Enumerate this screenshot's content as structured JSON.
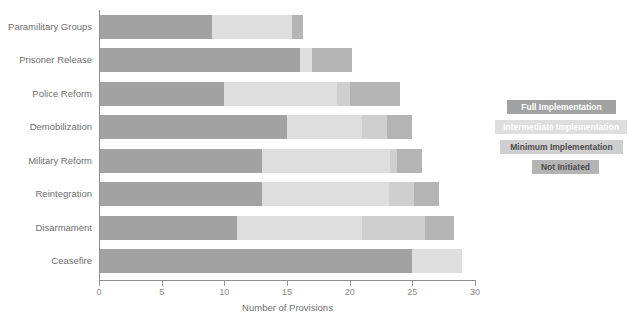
{
  "chart_data": {
    "type": "bar",
    "orientation": "horizontal",
    "stacked": true,
    "title": "",
    "xlabel": "Number of Provisions",
    "ylabel": "",
    "xlim": [
      0,
      30
    ],
    "xticks": [
      0,
      5,
      10,
      15,
      20,
      25,
      30
    ],
    "xtick_labels": [
      "0",
      "5",
      "10",
      "15",
      "20",
      "25",
      "30"
    ],
    "grid": false,
    "legend_position": "right",
    "categories": [
      "Paramilitary Groups",
      "Prisoner Release",
      "Police Reform",
      "Demobilization",
      "Military Reform",
      "Reintegration",
      "Disarmament",
      "Ceasefire"
    ],
    "series": [
      {
        "name": "Full Implementation",
        "color": "#a2a2a2",
        "values": [
          9,
          16,
          10,
          15,
          13,
          13,
          11,
          25
        ]
      },
      {
        "name": "Intermediate Implementation",
        "color": "#dedede",
        "values": [
          6.4,
          1,
          9,
          6,
          10.2,
          10.1,
          10,
          4
        ]
      },
      {
        "name": "Minimum Implementation",
        "color": "#cfcfcf",
        "values": [
          0,
          0,
          1,
          2,
          0.6,
          2,
          5,
          0
        ]
      },
      {
        "name": "Not Initiated",
        "color": "#b4b4b4",
        "values": [
          0.9,
          3.2,
          4,
          2,
          2,
          2,
          2.3,
          0
        ]
      }
    ],
    "totals": [
      16.3,
      20.2,
      24,
      25,
      25.8,
      27.1,
      28.3,
      29
    ]
  },
  "legend": {
    "items": [
      {
        "label": "Full Implementation",
        "key": "full"
      },
      {
        "label": "Intermediate Implementation",
        "key": "intermediate"
      },
      {
        "label": "Minimum Implementation",
        "key": "minimum"
      },
      {
        "label": "Not Initiated",
        "key": "notinit"
      }
    ]
  },
  "colors": {
    "full": "#a2a2a2",
    "intermediate": "#dedede",
    "minimum": "#cfcfcf",
    "notinit": "#b4b4b4",
    "axis": "#8e8e8e",
    "text": "#6f6f6f",
    "background": "#ffffff"
  }
}
